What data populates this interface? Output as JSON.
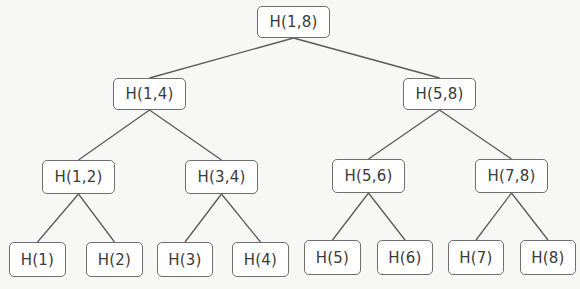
{
  "diagram": {
    "type": "merkle-tree",
    "nodes": [
      {
        "id": "root",
        "label": "H(1,8)",
        "level": 0
      },
      {
        "id": "1-4",
        "label": "H(1,4)",
        "level": 1,
        "parent": "root"
      },
      {
        "id": "5-8",
        "label": "H(5,8)",
        "level": 1,
        "parent": "root"
      },
      {
        "id": "1-2",
        "label": "H(1,2)",
        "level": 2,
        "parent": "1-4"
      },
      {
        "id": "3-4",
        "label": "H(3,4)",
        "level": 2,
        "parent": "1-4"
      },
      {
        "id": "5-6",
        "label": "H(5,6)",
        "level": 2,
        "parent": "5-8"
      },
      {
        "id": "7-8",
        "label": "H(7,8)",
        "level": 2,
        "parent": "5-8"
      },
      {
        "id": "1",
        "label": "H(1)",
        "level": 3,
        "parent": "1-2"
      },
      {
        "id": "2",
        "label": "H(2)",
        "level": 3,
        "parent": "1-2"
      },
      {
        "id": "3",
        "label": "H(3)",
        "level": 3,
        "parent": "3-4"
      },
      {
        "id": "4",
        "label": "H(4)",
        "level": 3,
        "parent": "3-4"
      },
      {
        "id": "5",
        "label": "H(5)",
        "level": 3,
        "parent": "5-6"
      },
      {
        "id": "6",
        "label": "H(6)",
        "level": 3,
        "parent": "5-6"
      },
      {
        "id": "7",
        "label": "H(7)",
        "level": 3,
        "parent": "7-8"
      },
      {
        "id": "8",
        "label": "H(8)",
        "level": 3,
        "parent": "7-8"
      }
    ]
  }
}
